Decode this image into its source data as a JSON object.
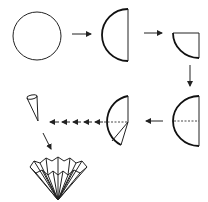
{
  "diagram": {
    "title": "",
    "colors": {
      "line": "#222222",
      "background": "#ffffff"
    },
    "steps": [
      {
        "id": "circle",
        "description": "Full circle"
      },
      {
        "id": "half-circle",
        "description": "Circle folded in half"
      },
      {
        "id": "quarter-circle",
        "description": "Half folded into quarter"
      },
      {
        "id": "half-circle-unfolded",
        "description": "Unfolded half with center crease (dashed)"
      },
      {
        "id": "half-circle-segment",
        "description": "Half circle with a narrow wedge marked"
      },
      {
        "id": "cone",
        "description": "Wedge rolled into a cone"
      },
      {
        "id": "fluted-fan",
        "description": "Pleated fluted fan/cone shape"
      }
    ],
    "arrows": [
      {
        "from": "circle",
        "to": "half-circle",
        "direction": "right"
      },
      {
        "from": "half-circle",
        "to": "quarter-circle",
        "direction": "right"
      },
      {
        "from": "quarter-circle",
        "to": "half-circle-unfolded",
        "direction": "down"
      },
      {
        "from": "half-circle-unfolded",
        "to": "half-circle-segment",
        "direction": "left"
      },
      {
        "from": "half-circle-segment",
        "to": "cone",
        "direction": "left",
        "style": "dashed"
      },
      {
        "from": "cone",
        "to": "fluted-fan",
        "direction": "down-right"
      }
    ]
  }
}
